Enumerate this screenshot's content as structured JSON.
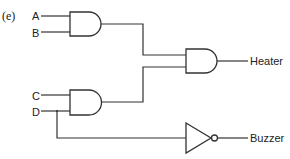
{
  "diagram": {
    "part_label": "(e)",
    "inputs": [
      {
        "id": "A",
        "label": "A"
      },
      {
        "id": "B",
        "label": "B"
      },
      {
        "id": "C",
        "label": "C"
      },
      {
        "id": "D",
        "label": "D"
      }
    ],
    "gates": [
      {
        "id": "and1",
        "type": "AND",
        "inputs": [
          "A",
          "B"
        ]
      },
      {
        "id": "and2",
        "type": "AND",
        "inputs": [
          "C",
          "D"
        ]
      },
      {
        "id": "and3",
        "type": "AND",
        "inputs": [
          "and1",
          "and2"
        ],
        "output": "Heater"
      },
      {
        "id": "not1",
        "type": "NOT",
        "inputs": [
          "D"
        ],
        "output": "Buzzer"
      }
    ],
    "outputs": [
      {
        "id": "heater",
        "label": "Heater"
      },
      {
        "id": "buzzer",
        "label": "Buzzer"
      }
    ]
  }
}
